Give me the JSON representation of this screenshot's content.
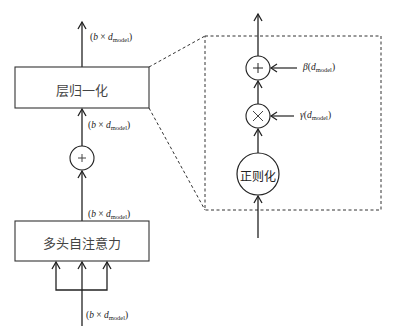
{
  "diagram": {
    "left_block": {
      "layer_norm_box": {
        "label": "层归一化"
      },
      "attention_box": {
        "label": "多头自注意力"
      },
      "add_node": {
        "symbol": "+"
      },
      "dims": {
        "output": {
          "open": "(",
          "b": "b",
          "times": " × ",
          "d": "d",
          "sub": "model",
          "close": ")"
        },
        "after_add": {
          "open": "(",
          "b": "b",
          "times": " × ",
          "d": "d",
          "sub": "model",
          "close": ")"
        },
        "after_attention": {
          "open": "(",
          "b": "b",
          "times": " × ",
          "d": "d",
          "sub": "model",
          "close": ")"
        },
        "input": {
          "open": "(",
          "b": "b",
          "times": " × ",
          "d": "d",
          "sub": "model",
          "close": ")"
        }
      }
    },
    "zoom_panel": {
      "normalize_node": {
        "label": "正则化"
      },
      "scale_node": {
        "symbol": "×"
      },
      "shift_node": {
        "symbol": "+"
      },
      "beta": {
        "sym": "β",
        "open": "(",
        "d": "d",
        "sub": "model",
        "close": ")"
      },
      "gamma": {
        "sym": "γ",
        "open": "(",
        "d": "d",
        "sub": "model",
        "close": ")"
      }
    },
    "colors": {
      "stroke": "#222222",
      "background": "#ffffff"
    }
  }
}
